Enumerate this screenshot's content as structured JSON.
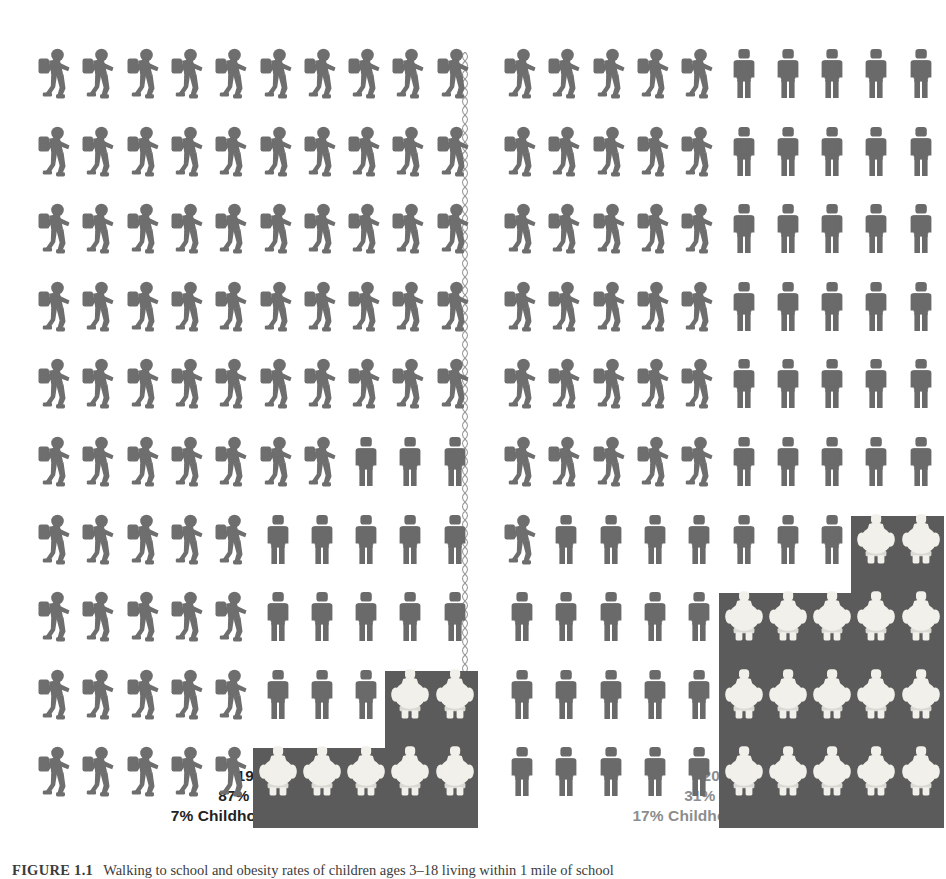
{
  "figure": {
    "background_color": "#ffffff"
  },
  "colors": {
    "walker": "#6e6e6e",
    "stander": "#6a6a6a",
    "obese_figure": "#f2f0ea",
    "obesity_box": "#5b5b5b",
    "caption_1969": "#222222",
    "caption_2012": "#8d8d8d",
    "divider": "#9a9a9a"
  },
  "panels": [
    {
      "id": "1969",
      "year_label": "1969",
      "walk_label": "87% Walk",
      "obesity_label": "7% Childhood Obesity",
      "walk_percent": 87,
      "obesity_percent": 7,
      "columns": 10,
      "rows": 10,
      "row_layout": [
        {
          "walk": 10,
          "stand": 0,
          "obese": 0
        },
        {
          "walk": 10,
          "stand": 0,
          "obese": 0
        },
        {
          "walk": 10,
          "stand": 0,
          "obese": 0
        },
        {
          "walk": 10,
          "stand": 0,
          "obese": 0
        },
        {
          "walk": 10,
          "stand": 0,
          "obese": 0
        },
        {
          "walk": 7,
          "stand": 3,
          "obese": 0
        },
        {
          "walk": 5,
          "stand": 5,
          "obese": 0
        },
        {
          "walk": 5,
          "stand": 5,
          "obese": 0
        },
        {
          "walk": 5,
          "stand": 3,
          "obese": 2
        },
        {
          "walk": 5,
          "stand": 0,
          "obese": 5
        }
      ]
    },
    {
      "id": "2012",
      "year_label": "2012",
      "walk_label": "31% Walk",
      "obesity_label": "17% Childhood Obesity",
      "walk_percent": 31,
      "obesity_percent": 17,
      "columns": 10,
      "rows": 10,
      "row_layout": [
        {
          "walk": 5,
          "stand": 5,
          "obese": 0
        },
        {
          "walk": 5,
          "stand": 5,
          "obese": 0
        },
        {
          "walk": 5,
          "stand": 5,
          "obese": 0
        },
        {
          "walk": 5,
          "stand": 5,
          "obese": 0
        },
        {
          "walk": 5,
          "stand": 5,
          "obese": 0
        },
        {
          "walk": 5,
          "stand": 5,
          "obese": 0
        },
        {
          "walk": 1,
          "stand": 7,
          "obese": 2
        },
        {
          "walk": 0,
          "stand": 5,
          "obese": 5
        },
        {
          "walk": 0,
          "stand": 5,
          "obese": 5
        },
        {
          "walk": 0,
          "stand": 5,
          "obese": 5
        }
      ]
    }
  ],
  "icons": {
    "walker": "walking-child-with-backpack-icon",
    "stander": "standing-child-icon",
    "obese": "obese-child-icon",
    "divider": "chain-divider-icon"
  },
  "source_caption": {
    "lead": "FIGURE 1.1",
    "text": "Walking to school and obesity rates of children ages 3–18 living within 1 mile of school"
  },
  "chart_data": {
    "type": "pictogram",
    "unit": "1 icon = 1 percent of children",
    "total_icons_per_panel": 100,
    "categories": [
      "1969",
      "2012"
    ],
    "series": [
      {
        "name": "% Walk to school",
        "values": [
          87,
          31
        ]
      },
      {
        "name": "% Childhood obesity",
        "values": [
          7,
          17
        ]
      }
    ],
    "ylabel": "Percent of children",
    "ylim": [
      0,
      100
    ],
    "grid": false,
    "legend": "none",
    "annotations": [
      "1969: 87% Walk",
      "1969: 7% Childhood Obesity",
      "2012: 31% Walk",
      "2012: 17% Childhood Obesity"
    ]
  }
}
